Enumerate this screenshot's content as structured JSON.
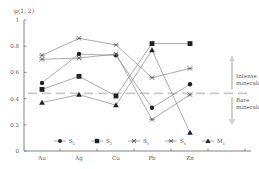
{
  "chart_data": {
    "type": "line",
    "title": "",
    "ylabel": "μ(1, 2)",
    "xlabel": "",
    "categories": [
      "Au",
      "Ag",
      "Cu",
      "Pb",
      "Zn"
    ],
    "ylim": [
      0,
      1
    ],
    "yticks": [
      "0",
      "0.2",
      "0.4",
      "0.6",
      "0.8",
      "1"
    ],
    "grid": false,
    "legend_position": "bottom-inside",
    "series": [
      {
        "name": "S1",
        "label": "S",
        "sub": "1",
        "marker": "circle",
        "values": [
          0.52,
          0.74,
          0.73,
          0.33,
          0.51
        ]
      },
      {
        "name": "S2",
        "label": "S",
        "sub": "2",
        "marker": "square",
        "values": [
          0.47,
          0.57,
          0.42,
          0.82,
          0.82
        ]
      },
      {
        "name": "S3",
        "label": "S",
        "sub": "3",
        "marker": "x",
        "values": [
          0.73,
          0.86,
          0.81,
          0.56,
          0.63
        ]
      },
      {
        "name": "S4",
        "label": "S",
        "sub": "4",
        "marker": "x",
        "values": [
          0.7,
          0.71,
          0.74,
          0.24,
          0.43
        ]
      },
      {
        "name": "M1",
        "label": "M",
        "sub": "1",
        "marker": "triangle",
        "values": [
          0.37,
          0.43,
          0.35,
          0.77,
          0.14
        ]
      }
    ],
    "threshold": {
      "value": 0.44,
      "style": "dashed",
      "color": "#c8c8c8"
    },
    "annotations": {
      "above": [
        "Intense",
        "mineralization"
      ],
      "below": [
        "Bare",
        "mineralization"
      ]
    }
  },
  "colors": {
    "line": "#888888",
    "marker": "#222222",
    "axis": "#666666",
    "arrow": "#cfcfcf"
  }
}
